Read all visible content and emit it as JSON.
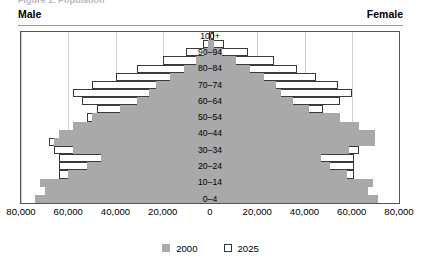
{
  "title_clipped": "Figure 1. Population",
  "header": {
    "male_label": "Male",
    "female_label": "Female"
  },
  "legend": {
    "items": [
      {
        "label": "2000",
        "swatch": "filled-square",
        "color": "#a9a9a9"
      },
      {
        "label": "2025",
        "swatch": "outline-square",
        "color": "#ffffff"
      }
    ]
  },
  "axis": {
    "x_ticks": [
      "80,000",
      "60,000",
      "40,000",
      "20,000",
      "0",
      "20,000",
      "40,000",
      "60,000",
      "80,000"
    ],
    "x_tick_values": [
      -80000,
      -60000,
      -40000,
      -20000,
      0,
      20000,
      40000,
      60000,
      80000
    ],
    "x_max": 80000,
    "y_labels_shown": [
      "0–4",
      "10–14",
      "20–24",
      "30–34",
      "40–44",
      "50–54",
      "60–64",
      "70–74",
      "80–84",
      "90–94",
      "100+"
    ]
  },
  "chart_data": {
    "type": "bar",
    "subtype": "population-pyramid",
    "title": "",
    "xlabel": "",
    "ylabel": "",
    "xlim": [
      -80000,
      80000
    ],
    "grid": true,
    "legend_position": "bottom-center",
    "categories": [
      "0–4",
      "5–9",
      "10–14",
      "15–19",
      "20–24",
      "25–29",
      "30–34",
      "35–39",
      "40–44",
      "45–49",
      "50–54",
      "55–59",
      "60–64",
      "65–69",
      "70–74",
      "75–79",
      "80–84",
      "85–89",
      "90–94",
      "95–99",
      "100+"
    ],
    "series": [
      {
        "name": "2000",
        "sex": "Male",
        "values": [
          74000,
          70000,
          72000,
          60000,
          52000,
          46000,
          58000,
          66000,
          64000,
          58000,
          50000,
          38000,
          31000,
          26000,
          23000,
          17000,
          11000,
          6000,
          2600,
          700,
          120
        ]
      },
      {
        "name": "2025",
        "sex": "Male",
        "values": [
          61000,
          62000,
          63000,
          64000,
          64000,
          64000,
          66000,
          68000,
          63000,
          56000,
          52000,
          48000,
          54000,
          58000,
          50000,
          40000,
          31000,
          20000,
          10000,
          3000,
          600
        ]
      },
      {
        "name": "2000",
        "sex": "Female",
        "values": [
          71000,
          67000,
          69000,
          58000,
          51000,
          47000,
          59000,
          70000,
          70000,
          63000,
          55000,
          42000,
          35000,
          30000,
          28000,
          23000,
          17000,
          11000,
          5000,
          1600,
          300
        ]
      },
      {
        "name": "2025",
        "sex": "Female",
        "values": [
          58000,
          59000,
          60000,
          61000,
          61000,
          61000,
          63000,
          65000,
          61000,
          55000,
          51000,
          48000,
          55000,
          60000,
          54000,
          45000,
          37000,
          27000,
          16000,
          6000,
          1500
        ]
      }
    ]
  }
}
